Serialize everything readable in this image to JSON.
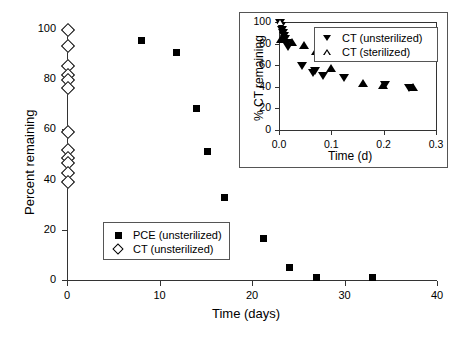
{
  "chart_data": [
    {
      "id": "main",
      "type": "scatter",
      "title": "",
      "xlabel": "Time (days)",
      "ylabel": "Percent remaining",
      "xlim": [
        0,
        40
      ],
      "ylim": [
        0,
        100
      ],
      "xticks": [
        0,
        10,
        20,
        30,
        40
      ],
      "yticks": [
        0,
        20,
        40,
        60,
        80,
        100
      ],
      "xticklabels": [
        "0",
        "10",
        "20",
        "30",
        "40"
      ],
      "yticklabels": [
        "0",
        "20",
        "40",
        "60",
        "80",
        "100"
      ],
      "grid": false,
      "legend_position": "lower-left-inside",
      "series": [
        {
          "name": "PCE (unsterilized)",
          "marker": "filled-square",
          "x": [
            8.0,
            11.8,
            14.0,
            15.2,
            17.0,
            21.2,
            24.0,
            27.0,
            33.0
          ],
          "y": [
            95.5,
            90.5,
            68.5,
            51.0,
            33.0,
            16.5,
            5.0,
            0.8,
            0.8
          ]
        },
        {
          "name": "CT (unsterilized)",
          "marker": "open-diamond",
          "x": [
            0,
            0,
            0,
            0,
            0,
            0,
            0,
            0,
            0,
            0,
            0,
            0
          ],
          "y": [
            100.0,
            93.5,
            85.5,
            82.0,
            80.0,
            77.0,
            59.5,
            52.0,
            49.0,
            47.0,
            43.0,
            39.5
          ]
        }
      ]
    },
    {
      "id": "inset",
      "type": "scatter",
      "title": "",
      "xlabel": "Time (d)",
      "ylabel": "% CT remaining",
      "xlim": [
        0.0,
        0.3
      ],
      "ylim": [
        0,
        100
      ],
      "xticks": [
        0.0,
        0.1,
        0.2,
        0.3
      ],
      "yticks": [
        0,
        20,
        40,
        60,
        80,
        100
      ],
      "xticklabels": [
        "0.0",
        "0.1",
        "0.2",
        "0.3"
      ],
      "yticklabels": [
        "0",
        "20",
        "40",
        "60",
        "80",
        "100"
      ],
      "grid": false,
      "legend_position": "upper-right-inside",
      "series": [
        {
          "name": "CT (unsterilized)",
          "marker": "filled-triangle-down",
          "x": [
            0.002,
            0.004,
            0.006,
            0.008,
            0.01,
            0.012,
            0.015,
            0.018,
            0.043,
            0.065,
            0.068,
            0.085,
            0.125,
            0.203,
            0.248
          ],
          "y": [
            99.0,
            96.0,
            93.0,
            90.0,
            87.0,
            84.0,
            81.0,
            77.0,
            59.0,
            53.0,
            55.0,
            50.0,
            48.0,
            42.0,
            39.0
          ]
        },
        {
          "name": "CT (sterilized)",
          "marker": "open-triangle-up",
          "x": [
            0.003,
            0.006,
            0.009,
            0.013,
            0.022,
            0.065,
            0.085,
            0.122,
            0.203,
            0.248
          ],
          "y": [
            100.0,
            97.0,
            94.0,
            89.0,
            73.0,
            59.0,
            57.0,
            56.0,
            43.0,
            37.0
          ]
        }
      ]
    }
  ],
  "main": {
    "ylabel": "Percent remaining",
    "xlabel": "Time (days)",
    "xticklabels": [
      "0",
      "10",
      "20",
      "30",
      "40"
    ],
    "yticklabels": [
      "0",
      "20",
      "40",
      "60",
      "80",
      "100"
    ],
    "legend": [
      {
        "label": "PCE (unsterilized)",
        "marker": "filled-square"
      },
      {
        "label": "CT (unsterilized)",
        "marker": "open-diamond"
      }
    ]
  },
  "inset": {
    "ylabel": "% CT remaining",
    "xlabel": "Time (d)",
    "xticklabels": [
      "0.0",
      "0.1",
      "0.2",
      "0.3"
    ],
    "yticklabels": [
      "0",
      "20",
      "40",
      "60",
      "80",
      "100"
    ],
    "legend": [
      {
        "label": "CT (unsterilized)",
        "marker": "filled-triangle-down"
      },
      {
        "label": "CT (sterilized)",
        "marker": "open-triangle-up"
      }
    ]
  },
  "colors": {
    "axis": "#333333",
    "marker": "#000000",
    "background": "#ffffff"
  }
}
